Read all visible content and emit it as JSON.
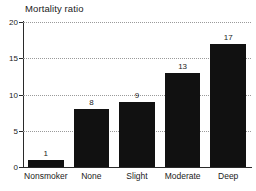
{
  "chart_data": {
    "type": "bar",
    "title": "Mortality ratio",
    "xlabel": "",
    "ylabel": "",
    "categories": [
      "Nonsmoker",
      "None",
      "Slight",
      "Moderate",
      "Deep"
    ],
    "values": [
      1,
      8,
      9,
      13,
      17
    ],
    "value_labels": [
      "1",
      "8",
      "9",
      "13",
      "17"
    ],
    "ylim": [
      0,
      20
    ],
    "yticks": [
      0,
      5,
      10,
      15,
      20
    ],
    "ytick_labels": [
      "0",
      "5",
      "10",
      "15",
      "20"
    ],
    "grid": true,
    "grid_axis": "y",
    "grid_style": "dotted",
    "legend": false,
    "bar_color": "#111111",
    "axis_color": "#2a2a2a",
    "grid_color": "#9a9a9a",
    "background": "#ffffff"
  }
}
